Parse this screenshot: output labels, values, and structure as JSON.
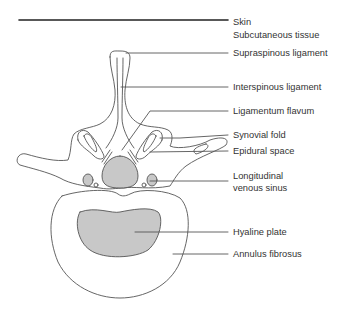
{
  "figure": {
    "colors": {
      "outline": "#555555",
      "fill_shaded": "#c8c8c8",
      "skin_line": "#222222",
      "leader_line": "#555555",
      "text": "#333333"
    },
    "labels": [
      {
        "id": "skin",
        "text": "Skin",
        "y": 16
      },
      {
        "id": "subcutaneous",
        "text": "Subcutaneous tissue",
        "y": 29
      },
      {
        "id": "supraspinous",
        "text": "Supraspinous ligament",
        "y": 47
      },
      {
        "id": "interspinous",
        "text": "Interspinous ligament",
        "y": 81
      },
      {
        "id": "flavum",
        "text": "Ligamentum flavum",
        "y": 105
      },
      {
        "id": "synovial",
        "text": "Synovial fold",
        "y": 129
      },
      {
        "id": "epidural",
        "text": "Epidural space",
        "y": 145
      },
      {
        "id": "venous1",
        "text": "Longitudinal",
        "y": 170
      },
      {
        "id": "venous2",
        "text": "venous sinus",
        "y": 182
      },
      {
        "id": "hyaline",
        "text": "Hyaline plate",
        "y": 226
      },
      {
        "id": "annulus",
        "text": "Annulus fibrosus",
        "y": 248
      }
    ]
  }
}
